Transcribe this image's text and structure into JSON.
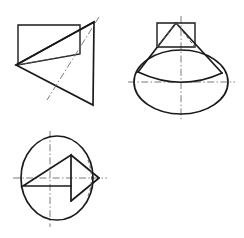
{
  "sheet": {
    "title": "Orthographic Projection — Oblique Cone on Rectangular Plinth",
    "width": 244,
    "height": 238,
    "background_color": "#ffffff",
    "line_colors": {
      "visible": "#1a1a1a",
      "hidden": "#5a5a5a",
      "center": "#6b6b6b"
    },
    "line_widths": {
      "visible": 1.7,
      "visible_thin": 1.4,
      "hidden": 1.0,
      "center": 0.9
    }
  },
  "views": [
    {
      "id": "top-left-view",
      "name": "pictorial-oblique-view",
      "label": "",
      "position": {
        "x": 0,
        "y": 0,
        "width": 122,
        "height": 119
      },
      "geometry": {
        "rectangle": {
          "name": "plinth-rectangle",
          "points": "18,25 80,25 80,54 18,65",
          "path": "M 18 25 L 80 25 L 80 54 L 18 65 Z",
          "style": "visible-thin"
        },
        "rectangle_hidden_edge": {
          "name": "plinth-hidden-edge",
          "path": "M 18 65 L 80 54",
          "style": "hidden"
        },
        "triangle": {
          "name": "cone-triangle",
          "points": "16,65 94,22 93,105",
          "path": "M 16 65 L 94 22 L 93 105 Z",
          "style": "visible"
        },
        "axis": {
          "name": "cone-axis-center-line",
          "path": "M 99 17 L 47 100",
          "style": "center"
        },
        "apex_edge": {
          "name": "apex-to-base-edge",
          "path": "M 94 22 L 16 65",
          "style": "visible"
        }
      }
    },
    {
      "id": "top-right-view",
      "name": "front-elevation-view",
      "label": "",
      "position": {
        "x": 122,
        "y": 0,
        "width": 122,
        "height": 119
      },
      "geometry": {
        "rectangle": {
          "name": "stem-rectangle",
          "path": "M 157 23 L 195 23 L 195 47 L 157 47 Z",
          "style": "visible-thin"
        },
        "ellipse": {
          "name": "cone-base-ellipse",
          "cx": 181,
          "cy": 82,
          "rx": 47,
          "ry": 32,
          "style": "visible"
        },
        "cone_left_side": {
          "name": "cone-left-slant-edge",
          "path": "M 176 23 L 138 72",
          "style": "visible"
        },
        "cone_right_side": {
          "name": "cone-right-slant-edge",
          "path": "M 176 23 L 222 73",
          "style": "visible"
        },
        "cone_base_chord": {
          "name": "cone-base-front-arc",
          "path": "M 138 72 Q 181 92 222 73",
          "style": "visible"
        },
        "hidden_left": {
          "name": "hidden-stem-left-edge",
          "path": "M 176 23 L 157 47",
          "style": "hidden"
        },
        "hidden_right": {
          "name": "hidden-stem-right-edge",
          "path": "M 176 23 L 195 47",
          "style": "hidden"
        },
        "vertical_center_line": {
          "name": "vertical-center-line",
          "path": "M 181 16 L 181 120",
          "style": "center"
        },
        "horizontal_center_line": {
          "name": "horizontal-center-line",
          "path": "M 128 82 L 235 82",
          "style": "center"
        }
      }
    },
    {
      "id": "bottom-left-view",
      "name": "plan-view",
      "label": "",
      "position": {
        "x": 0,
        "y": 119,
        "width": 122,
        "height": 119
      },
      "geometry": {
        "circle": {
          "name": "base-circle",
          "cx": 57,
          "cy": 178,
          "rx": 36,
          "ry": 42,
          "style": "visible"
        },
        "triangle": {
          "name": "inner-triangle",
          "path": "M 23 186 L 71 155 L 71 186 Z",
          "style": "visible"
        },
        "right_point_upper": {
          "name": "apex-point-upper-edge",
          "path": "M 71 155 L 99 178",
          "style": "visible"
        },
        "right_point_lower": {
          "name": "apex-point-lower-edge",
          "path": "M 99 178 L 71 201",
          "style": "visible"
        },
        "triangle_base_extension": {
          "name": "triangle-base-extension",
          "path": "M 71 186 L 71 201",
          "style": "visible"
        },
        "hidden_arc": {
          "name": "hidden-circle-arc",
          "path": "M 88 160 Q 95 178 88 196",
          "style": "hidden"
        },
        "vertical_center_line": {
          "name": "vertical-center-line",
          "path": "M 50 131 L 50 227",
          "style": "center"
        },
        "horizontal_center_line": {
          "name": "horizontal-center-line",
          "path": "M 13 178 L 107 178",
          "style": "center"
        }
      }
    }
  ],
  "legend": {
    "visible_line_name": "visible-outline",
    "hidden_line_name": "hidden-outline",
    "center_line_name": "center-line"
  }
}
